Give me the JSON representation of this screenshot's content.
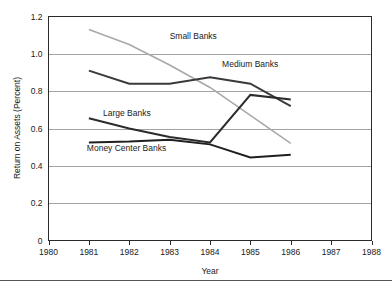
{
  "chart_data": {
    "type": "line",
    "title": "",
    "subtitle": "",
    "xlabel": "Year",
    "ylabel": "Return on Assets (Percent)",
    "xlim": [
      1980,
      1988
    ],
    "ylim": [
      0,
      1.2
    ],
    "xticks": [
      1980,
      1981,
      1982,
      1983,
      1984,
      1985,
      1986,
      1987,
      1988
    ],
    "xtick_labels": [
      "1980",
      "1981",
      "1982",
      "1983",
      "1984",
      "1985",
      "1986",
      "1987",
      "1988"
    ],
    "yticks": [
      0,
      0.2,
      0.4,
      0.6,
      0.8,
      1.0,
      1.2
    ],
    "ytick_labels": [
      "0",
      "0.2",
      "0.4",
      "0.6",
      "0.8",
      "1.0",
      "1.2"
    ],
    "grid": "horizontal",
    "legend_position": "inline-annotations",
    "x": [
      1981,
      1982,
      1983,
      1984,
      1985,
      1986
    ],
    "series": [
      {
        "name": "Small Banks",
        "color": "#a9a9a9",
        "width": 1.6,
        "values": [
          1.13,
          1.05,
          0.94,
          0.82,
          0.67,
          0.52
        ],
        "label_x": 1983.0,
        "label_y": 1.08
      },
      {
        "name": "Medium Banks",
        "color": "#3a3a3a",
        "width": 2.0,
        "values": [
          0.91,
          0.84,
          0.84,
          0.875,
          0.84,
          0.72
        ],
        "label_x": 1984.3,
        "label_y": 0.93
      },
      {
        "name": "Large Banks",
        "color": "#2b2b2b",
        "width": 2.0,
        "values": [
          0.655,
          0.6,
          0.555,
          0.525,
          0.78,
          0.755
        ],
        "label_x": 1981.35,
        "label_y": 0.665
      },
      {
        "name": "Money Center Banks",
        "color": "#1f1f1f",
        "width": 2.0,
        "values": [
          0.525,
          0.53,
          0.54,
          0.515,
          0.445,
          0.46
        ],
        "label_x": 1980.95,
        "label_y": 0.478
      }
    ]
  },
  "axes": {
    "y_title": "Return on Assets (Percent)",
    "x_title": "Year"
  },
  "colors": {
    "axis": "#2b2b2b",
    "grid": "#8c8c8c",
    "background": "#ffffff",
    "text": "#1a1a1a"
  }
}
